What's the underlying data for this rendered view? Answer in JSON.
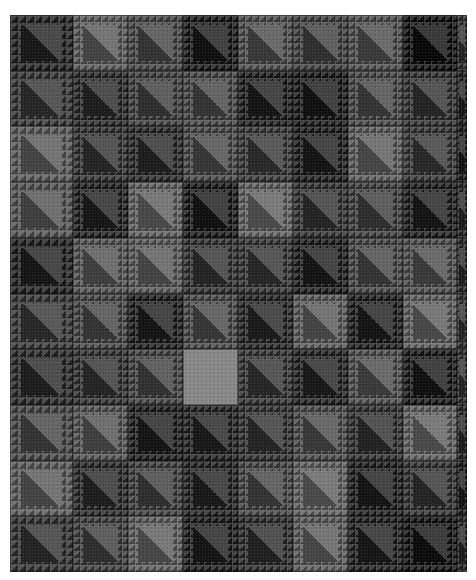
{
  "image": {
    "subject": "grayscale patchwork quilt",
    "pattern": "half-square triangle blocks with sawtooth borders",
    "background": "#ffffff"
  },
  "quilt": {
    "cols": 9,
    "rows": 10,
    "col_edges": [
      0,
      63,
      118,
      173,
      228,
      283,
      338,
      393,
      447,
      457
    ],
    "row_pitch": 55.7,
    "blocks": [
      [
        "#2e2e2e",
        "#5a5a5a",
        "#4a4a4a",
        "#262626",
        "#4f4f4f",
        "#454545",
        "#505050",
        "#1e1e1e",
        "#3a3a3a"
      ],
      [
        "#3c3c3c",
        "#333333",
        "#444444",
        "#4a4a4a",
        "#2a2a2a",
        "#262626",
        "#4a4a4a",
        "#3a3a3a",
        "#2e2e2e"
      ],
      [
        "#5a5a5a",
        "#3a3a3a",
        "#333333",
        "#4c4c4c",
        "#3f3f3f",
        "#2a2a2a",
        "#5c5c5c",
        "#3e3e3e",
        "#2a2a2a"
      ],
      [
        "#555555",
        "#2c2c2c",
        "#5f5f5f",
        "#262626",
        "#606060",
        "#3a3a3a",
        "#444444",
        "#2a2a2a",
        "#333333"
      ],
      [
        "#2c2c2c",
        "#555555",
        "#5a5a5a",
        "#3a3a3a",
        "#3c3c3c",
        "#2a2a2a",
        "#4a4a4a",
        "#505050",
        "#333333"
      ],
      [
        "#3e3e3e",
        "#4a4a4a",
        "#2a2a2a",
        "#4c4c4c",
        "#303030",
        "#5a5a5a",
        "#2a2a2a",
        "#5e5e5e",
        "#3a3a3a"
      ],
      [
        "#333333",
        "#3a3a3a",
        "#474747",
        "#8a8a8a",
        "#3c3c3c",
        "#2e2e2e",
        "#505050",
        "#262626",
        "#3a3a3a"
      ],
      [
        "#4a4a4a",
        "#555555",
        "#2a2a2a",
        "#2e2e2e",
        "#3a3a3a",
        "#4e4e4e",
        "#383838",
        "#606060",
        "#333333"
      ],
      [
        "#5a5a5a",
        "#333333",
        "#444444",
        "#2e2e2e",
        "#4a4a4a",
        "#606060",
        "#2a2a2a",
        "#3a3a3a",
        "#2a2a2a"
      ],
      [
        "#3a3a3a",
        "#444444",
        "#5e5e5e",
        "#2a2a2a",
        "#363636",
        "#5c5c5c",
        "#2c2c2c",
        "#222222",
        "#333333"
      ]
    ],
    "highlight_block": {
      "row": 6,
      "col": 3,
      "color": "#8a8a8a"
    }
  }
}
